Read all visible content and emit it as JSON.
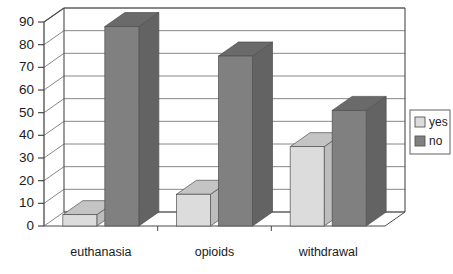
{
  "chart_data": {
    "type": "bar",
    "title": "",
    "subtitle": "",
    "xlabel": "",
    "ylabel": "",
    "categories": [
      "euthanasia",
      "opioids",
      "withdrawal"
    ],
    "series": [
      {
        "name": "yes",
        "values": [
          5,
          14,
          35
        ],
        "color": "#dcdcdc"
      },
      {
        "name": "no",
        "values": [
          88,
          75,
          51
        ],
        "color": "#808080"
      }
    ],
    "ylim": [
      0,
      90
    ],
    "yticks": [
      0,
      10,
      20,
      30,
      40,
      50,
      60,
      70,
      80,
      90
    ],
    "ytick_labels": [
      "0",
      "10",
      "20",
      "30",
      "40",
      "50",
      "60",
      "70",
      "80",
      "90"
    ],
    "grid": true,
    "grid_axis": "y",
    "legend_position": "right",
    "style": "3d-bar",
    "legend_entries": [
      {
        "label": "yes",
        "swatch": "#dcdcdc"
      },
      {
        "label": "no",
        "swatch": "#808080"
      }
    ]
  },
  "colors": {
    "yes_face": "#dcdcdc",
    "yes_top": "#c4c4c4",
    "yes_side": "#bdbdbd",
    "no_face": "#808080",
    "no_top": "#6a6a6a",
    "no_side": "#636363",
    "axis": "#4a4a4a",
    "grid": "#7a7a7a",
    "text": "#1b1b1b",
    "background": "#ffffff"
  },
  "axis": {
    "tick_0": "0",
    "tick_10": "10",
    "tick_20": "20",
    "tick_30": "30",
    "tick_40": "40",
    "tick_50": "50",
    "tick_60": "60",
    "tick_70": "70",
    "tick_80": "80",
    "tick_90": "90"
  },
  "categories_text": {
    "cat_0": "euthanasia",
    "cat_1": "opioids",
    "cat_2": "withdrawal"
  },
  "legend": {
    "item_0_label": "yes",
    "item_1_label": "no"
  }
}
